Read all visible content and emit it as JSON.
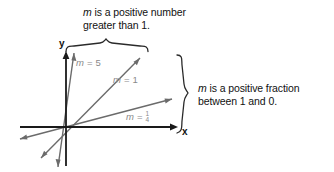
{
  "figure": {
    "type": "coordinate-plane-slope-diagram",
    "background_color": "#ffffff",
    "axis_color": "#1a1a1a",
    "ray_color": "#6b6b6b",
    "brace_color": "#2a2a2a",
    "label_color": "#8a8a8a",
    "text_color": "#111111"
  },
  "axes": {
    "x_label": "x",
    "y_label": "y",
    "origin": {
      "x": 66,
      "y": 127
    },
    "x_axis": {
      "start_x": 20,
      "end_x": 176,
      "y": 127,
      "arrow": "right"
    },
    "y_axis": {
      "x": 66,
      "start_y": 166,
      "end_y": 52,
      "arrow": "up"
    }
  },
  "rays": [
    {
      "name": "ray-slope-5",
      "slope": 5,
      "label": "m = 5",
      "label_prefix": "m",
      "label_equals": "=",
      "label_value": "5",
      "tip": {
        "x": 74,
        "y": 52
      },
      "tail": {
        "x": 58,
        "y": 167
      }
    },
    {
      "name": "ray-slope-1",
      "slope": 1,
      "label": "m = 1",
      "label_prefix": "m",
      "label_equals": "=",
      "label_value": "1",
      "tip": {
        "x": 140,
        "y": 57
      },
      "tail": {
        "x": 41,
        "y": 158
      }
    },
    {
      "name": "ray-slope-one-quarter",
      "slope": 0.25,
      "label": "m = 1/4",
      "label_prefix": "m",
      "label_equals": "=",
      "label_numerator": "1",
      "label_denominator": "4",
      "tip": {
        "x": 172,
        "y": 98
      },
      "tail": {
        "x": 20,
        "y": 137
      }
    }
  ],
  "annotations": {
    "top": {
      "name": "positive-number-annotation",
      "line1": "m is a positive number",
      "line2": "greater than 1.",
      "line1_var": "m",
      "line1_rest": " is a positive number",
      "brace": {
        "orientation": "horizontal-up",
        "start_x": 66,
        "end_x": 148,
        "apex_x": 106,
        "y": 46
      }
    },
    "right": {
      "name": "positive-fraction-annotation",
      "line1": "m is a positive fraction",
      "line2": "between 1 and 0.",
      "line1_var": "m",
      "line1_rest": " is a positive fraction",
      "brace": {
        "orientation": "vertical-right",
        "start_y": 55,
        "end_y": 133,
        "apex_y": 93,
        "x": 186
      }
    }
  }
}
